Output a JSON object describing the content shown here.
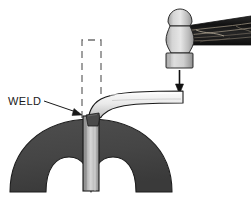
{
  "figure": {
    "background_color": "#ffffff"
  },
  "labels": {
    "weld": "WELD"
  },
  "colors": {
    "background": "#ffffff",
    "anvil_fill": "#474747",
    "anvil_stroke": "#1c1c1c",
    "bar_light": "#f2f2f2",
    "bar_mid": "#c9c9c9",
    "bar_dark": "#8a8a8a",
    "weld_fill": "#4a4a4a",
    "hammer_head_light": "#dcdcdc",
    "hammer_head_dark": "#9a9a9a",
    "handle_dark": "#1f1f1f",
    "handle_grain": "#b0a89a",
    "outline": "#1a1a1a",
    "dashed_line": "#6e6e6e",
    "arrow": "#111111",
    "text": "#1a1a1a"
  },
  "elements": {
    "hammer": {
      "name": "ball-peen-hammer",
      "peen_label": "ball-peen",
      "face_label": "hammer-face",
      "handle_label": "wood-handle"
    },
    "force_arrow": {
      "name": "downward-force-arrow",
      "direction": "down"
    },
    "workpiece": {
      "name": "bent-bar",
      "vertical_leg": "vertical-bar-leg",
      "horizontal_leg": "horizontal-bar-leg",
      "bend_radius_note": "curved-bend"
    },
    "ghost_outline": {
      "name": "original-bar-position",
      "style": "dashed"
    },
    "die": {
      "name": "arched-die-anvil",
      "cutouts": 2
    },
    "weld_joint": {
      "name": "weld-fillet"
    },
    "leader": {
      "name": "weld-leader-line"
    }
  }
}
